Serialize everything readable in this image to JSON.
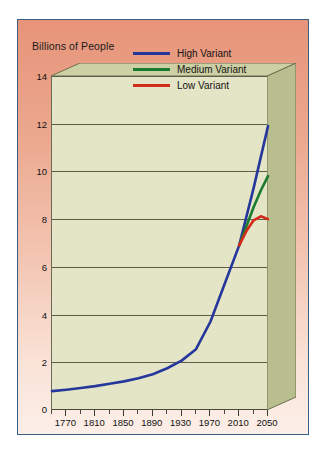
{
  "figure": {
    "title": "Billions of People",
    "background_top_color": "#E79479",
    "background_bottom_color": "#FCEFE8",
    "frame_border_color": "#3A5F86",
    "plot_face_color": "#E4E4C6",
    "plot_side_color": "#B9BE8F",
    "plot_top_color": "#CDD0A4",
    "gridline_color": "#5D5D4C"
  },
  "legend": {
    "position": "top-right-inside",
    "entries": [
      {
        "label": "High Variant",
        "color": "#26379B"
      },
      {
        "label": "Medium Variant",
        "color": "#1A7A2E"
      },
      {
        "label": "Low Variant",
        "color": "#D42A1A"
      }
    ]
  },
  "chart_data": {
    "type": "line",
    "title": "Billions of People",
    "xlabel": "",
    "ylabel": "Billions of People",
    "xlim": [
      1750,
      2050
    ],
    "ylim": [
      0,
      14
    ],
    "grid": true,
    "legend_position": "upper right",
    "ytick_labels": [
      "0",
      "2",
      "4",
      "6",
      "8",
      "10",
      "12",
      "14"
    ],
    "ytick_values": [
      0,
      2,
      4,
      6,
      8,
      10,
      12,
      14
    ],
    "xtick_labels": [
      "1770",
      "1810",
      "1850",
      "1890",
      "1930",
      "1970",
      "2010",
      "2050"
    ],
    "xtick_values": [
      1770,
      1810,
      1850,
      1890,
      1930,
      1970,
      2010,
      2050
    ],
    "xtick_minor_values": [
      1750,
      1790,
      1830,
      1870,
      1910,
      1950,
      1990,
      2030
    ],
    "series": [
      {
        "name": "High Variant",
        "color": "#26379B",
        "x": [
          1750,
          1770,
          1790,
          1810,
          1830,
          1850,
          1870,
          1890,
          1910,
          1930,
          1950,
          1970,
          1990,
          2010,
          2030,
          2050
        ],
        "values": [
          0.79,
          0.85,
          0.92,
          1.0,
          1.1,
          1.2,
          1.33,
          1.5,
          1.75,
          2.07,
          2.55,
          3.7,
          5.3,
          6.9,
          9.3,
          11.9
        ]
      },
      {
        "name": "Medium Variant",
        "color": "#1A7A2E",
        "x": [
          2010,
          2020,
          2030,
          2040,
          2050
        ],
        "values": [
          6.9,
          7.7,
          8.5,
          9.2,
          9.8
        ]
      },
      {
        "name": "Low Variant",
        "color": "#D42A1A",
        "x": [
          2010,
          2020,
          2030,
          2040,
          2050
        ],
        "values": [
          6.9,
          7.5,
          7.95,
          8.12,
          8.0
        ]
      }
    ]
  }
}
